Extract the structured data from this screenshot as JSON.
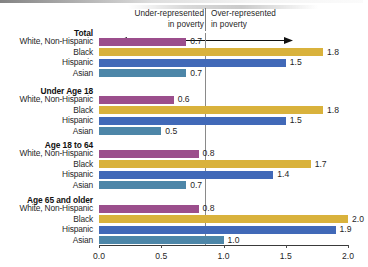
{
  "chart_data": {
    "type": "bar",
    "title": "",
    "xlabel": "",
    "ylabel": "",
    "orientation": "horizontal",
    "xlim": [
      0.0,
      2.0
    ],
    "xticks": [
      "0.0",
      "0.5",
      "1.0",
      "1.5",
      "2.0"
    ],
    "xtick_values": [
      0.0,
      0.5,
      1.0,
      1.5,
      2.0
    ],
    "grid": false,
    "reference_line": 1.0,
    "legend": "none",
    "annotations": {
      "left_line1": "Under-represented",
      "left_line2": "in poverty",
      "right_line1": "Over-represented",
      "right_line2": "in poverty",
      "arrow": "double-headed-arrow"
    },
    "categories": [
      "White, Non-Hispanic",
      "Black",
      "Hispanic",
      "Asian"
    ],
    "colors": {
      "White, Non-Hispanic": "#9B4E8C",
      "Black": "#D9B23C",
      "Hispanic": "#4169B8",
      "Asian": "#4D86A8"
    },
    "groups": [
      {
        "name": "Total",
        "rows": [
          {
            "label": "White, Non-Hispanic",
            "value": 0.7,
            "display": "0.7",
            "color": "#9B4E8C"
          },
          {
            "label": "Black",
            "value": 1.8,
            "display": "1.8",
            "color": "#D9B23C"
          },
          {
            "label": "Hispanic",
            "value": 1.5,
            "display": "1.5",
            "color": "#4169B8"
          },
          {
            "label": "Asian",
            "value": 0.7,
            "display": "0.7",
            "color": "#4D86A8"
          }
        ]
      },
      {
        "name": "Under Age 18",
        "rows": [
          {
            "label": "White, Non-Hispanic",
            "value": 0.6,
            "display": "0.6",
            "color": "#9B4E8C"
          },
          {
            "label": "Black",
            "value": 1.8,
            "display": "1.8",
            "color": "#D9B23C"
          },
          {
            "label": "Hispanic",
            "value": 1.5,
            "display": "1.5",
            "color": "#4169B8"
          },
          {
            "label": "Asian",
            "value": 0.5,
            "display": "0.5",
            "color": "#4D86A8"
          }
        ]
      },
      {
        "name": "Age 18 to 64",
        "rows": [
          {
            "label": "White, Non-Hispanic",
            "value": 0.8,
            "display": "0.8",
            "color": "#9B4E8C"
          },
          {
            "label": "Black",
            "value": 1.7,
            "display": "1.7",
            "color": "#D9B23C"
          },
          {
            "label": "Hispanic",
            "value": 1.4,
            "display": "1.4",
            "color": "#4169B8"
          },
          {
            "label": "Asian",
            "value": 0.7,
            "display": "0.7",
            "color": "#4D86A8"
          }
        ]
      },
      {
        "name": "Age 65 and older",
        "rows": [
          {
            "label": "White, Non-Hispanic",
            "value": 0.8,
            "display": "0.8",
            "color": "#9B4E8C"
          },
          {
            "label": "Black",
            "value": 2.0,
            "display": "2.0",
            "color": "#D9B23C"
          },
          {
            "label": "Hispanic",
            "value": 1.9,
            "display": "1.9",
            "color": "#4169B8"
          },
          {
            "label": "Asian",
            "value": 1.0,
            "display": "1.0",
            "color": "#4D86A8"
          }
        ]
      }
    ]
  }
}
